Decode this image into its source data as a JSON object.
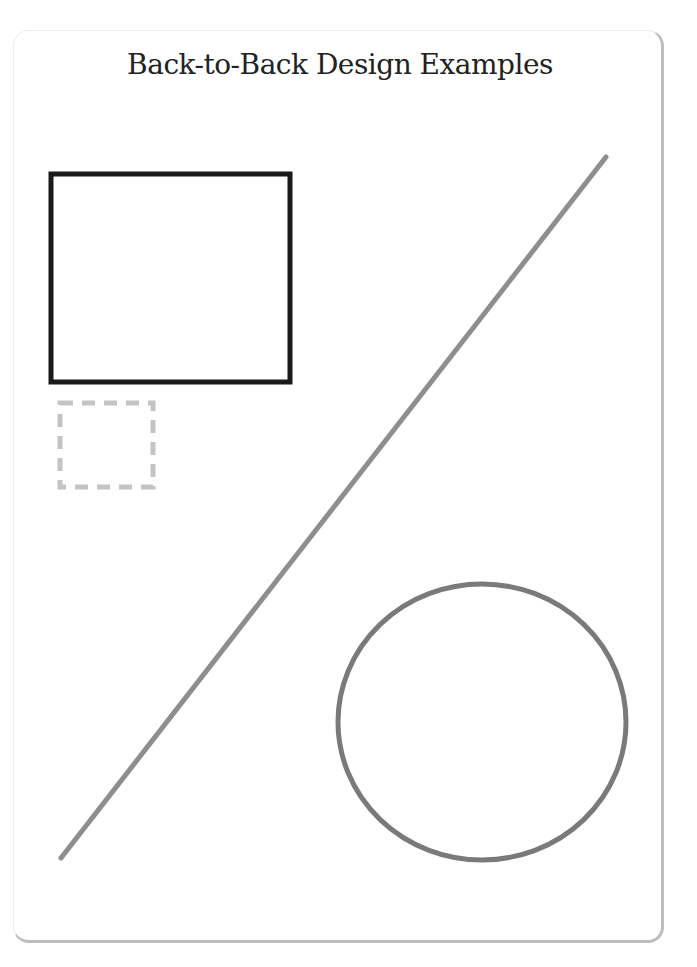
{
  "title": "Back-to-Back Design Examples",
  "shapes": {
    "solid_rect": {
      "x": 51,
      "y": 174,
      "w": 239,
      "h": 208,
      "stroke": "#1a1a1a",
      "stroke_width": 5
    },
    "dashed_rect": {
      "x": 60,
      "y": 403,
      "w": 93,
      "h": 84,
      "stroke": "#c4c4c4",
      "stroke_width": 5,
      "dash": "13 9"
    },
    "line": {
      "x1": 61,
      "y1": 858,
      "x2": 606,
      "y2": 157,
      "stroke": "#8e8e8e",
      "stroke_width": 5
    },
    "circle": {
      "cx": 482,
      "cy": 722,
      "rx": 144,
      "ry": 138,
      "stroke": "#7a7a7a",
      "stroke_width": 5
    }
  }
}
